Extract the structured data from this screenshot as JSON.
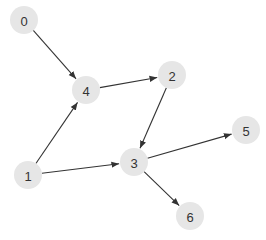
{
  "diagram": {
    "type": "directed-graph",
    "colors": {
      "node_fill": "#e6e6e6",
      "node_text": "#333333",
      "edge": "#333333",
      "background": "#ffffff"
    },
    "node_radius": 14,
    "nodes": [
      {
        "id": "0",
        "label": "0",
        "x": 24,
        "y": 20
      },
      {
        "id": "1",
        "label": "1",
        "x": 28,
        "y": 175
      },
      {
        "id": "2",
        "label": "2",
        "x": 172,
        "y": 75
      },
      {
        "id": "3",
        "label": "3",
        "x": 134,
        "y": 162
      },
      {
        "id": "4",
        "label": "4",
        "x": 86,
        "y": 90
      },
      {
        "id": "5",
        "label": "5",
        "x": 246,
        "y": 130
      },
      {
        "id": "6",
        "label": "6",
        "x": 190,
        "y": 216
      }
    ],
    "edges": [
      {
        "from": "0",
        "to": "4"
      },
      {
        "from": "4",
        "to": "2"
      },
      {
        "from": "2",
        "to": "3"
      },
      {
        "from": "1",
        "to": "4"
      },
      {
        "from": "1",
        "to": "3"
      },
      {
        "from": "3",
        "to": "5"
      },
      {
        "from": "3",
        "to": "6"
      }
    ]
  }
}
